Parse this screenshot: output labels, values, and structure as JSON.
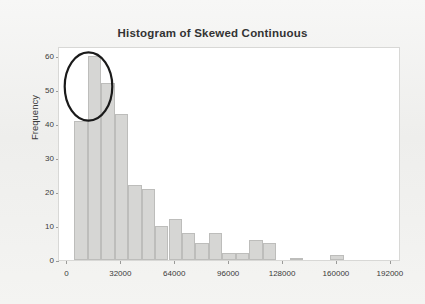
{
  "figure": {
    "background_color": "#f2f2f0",
    "plot_background_color": "#ffffff",
    "bar_fill_color": "#d6d6d4",
    "bar_border_color": "#bdbdbb",
    "annotation_color": "#1a1a1a"
  },
  "chart_data": {
    "type": "bar",
    "title": "Histogram of Skewed Continuous",
    "xlabel": "",
    "ylabel": "Frequency",
    "xlim": [
      -5000,
      198000
    ],
    "ylim": [
      0,
      63
    ],
    "xticks": [
      0,
      32000,
      64000,
      96000,
      128000,
      160000,
      192000
    ],
    "xtick_labels": [
      "0",
      "32000",
      "64000",
      "96000",
      "128000",
      "160000",
      "192000"
    ],
    "yticks": [
      0,
      10,
      20,
      30,
      40,
      50,
      60
    ],
    "ytick_labels": [
      "0",
      "10",
      "20",
      "30",
      "40",
      "50",
      "60"
    ],
    "grid": false,
    "legend": false,
    "bin_width": 8000,
    "bin_starts": [
      4000,
      12000,
      20000,
      28000,
      36000,
      44000,
      52000,
      60000,
      68000,
      76000,
      84000,
      92000,
      100000,
      108000,
      116000,
      124000,
      132000,
      140000,
      148000,
      156000,
      164000,
      172000,
      180000,
      188000
    ],
    "values": [
      41,
      60,
      52,
      43,
      22,
      21,
      10,
      12,
      8,
      5,
      8,
      2,
      2,
      6,
      5,
      0,
      0.5,
      0,
      0,
      1.5,
      0,
      0,
      0,
      0
    ],
    "annotations": [
      {
        "type": "ellipse",
        "label": "highlight-ellipse",
        "center_x": 16000,
        "center_y": 52,
        "width_x": 24000,
        "height_y": 22
      }
    ]
  }
}
